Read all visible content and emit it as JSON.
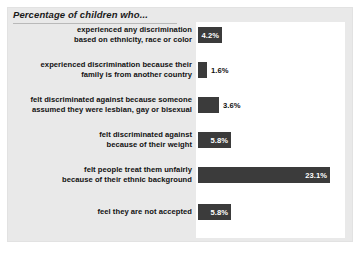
{
  "chart_data": {
    "type": "bar",
    "orientation": "horizontal",
    "title": "Percentage of children who...",
    "xlabel": "",
    "ylabel": "",
    "xlim": [
      0,
      26
    ],
    "grid": false,
    "legend": null,
    "value_suffix": "%",
    "bar_color": "#3b3b3b",
    "panel_color": "#e9e9e9",
    "plot_color": "#ffffff",
    "categories": [
      "experienced any discrimination based on ethnicity, race or color",
      "experienced discrimination because their family is from another country",
      "felt discriminated against because someone assumed they were lesbian, gay or bisexual",
      "felt discriminated against because of their weight",
      "felt people treat them unfairly because of their ethnic background",
      "feel they are not accepted"
    ],
    "values": [
      4.2,
      1.6,
      3.6,
      5.8,
      23.1,
      5.8
    ],
    "value_labels": [
      "4.2%",
      "1.6%",
      "3.6%",
      "5.8%",
      "23.1%",
      "5.8%"
    ]
  },
  "rows": [
    {
      "label_line1": "experienced any discrimination",
      "label_line2": "based on ethnicity, race or color",
      "value": "4.2%",
      "label_inside": true
    },
    {
      "label_line1": "experienced discrimination because their",
      "label_line2": "family is from another country",
      "value": "1.6%",
      "label_inside": false
    },
    {
      "label_line1": "felt discriminated against because someone",
      "label_line2": "assumed they were lesbian, gay or bisexual",
      "value": "3.6%",
      "label_inside": false
    },
    {
      "label_line1": "felt discriminated against",
      "label_line2": "because of their weight",
      "value": "5.8%",
      "label_inside": true
    },
    {
      "label_line1": "felt people treat them unfairly",
      "label_line2": "because of their ethnic background",
      "value": "23.1%",
      "label_inside": true
    },
    {
      "label_line1": "feel they are not accepted",
      "label_line2": "",
      "value": "5.8%",
      "label_inside": true
    }
  ]
}
